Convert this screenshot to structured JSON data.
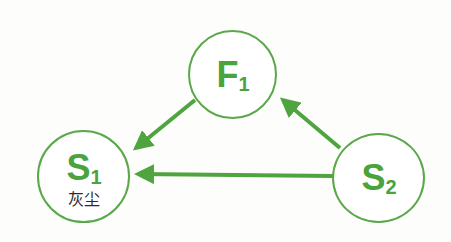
{
  "diagram": {
    "accent_color": "#5aa84a",
    "nodes": [
      {
        "id": "F1",
        "letter": "F",
        "subscript": "1",
        "caption": ""
      },
      {
        "id": "S1",
        "letter": "S",
        "subscript": "1",
        "caption": "灰尘"
      },
      {
        "id": "S2",
        "letter": "S",
        "subscript": "2",
        "caption": ""
      }
    ],
    "edges": [
      {
        "from": "F1",
        "to": "S1"
      },
      {
        "from": "S2",
        "to": "F1"
      },
      {
        "from": "S2",
        "to": "S1"
      }
    ]
  }
}
